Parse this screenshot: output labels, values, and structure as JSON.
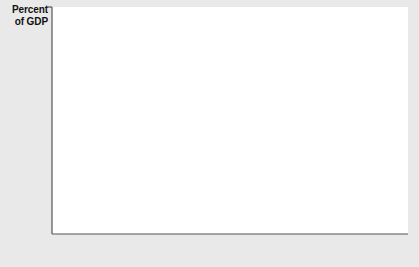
{
  "chart_data": {
    "type": "line",
    "title": "",
    "subtitle": "",
    "ylabel": "Percent of GDP",
    "xlabel": "",
    "ylim": [
      -4,
      4
    ],
    "xlim": [
      1960,
      2001
    ],
    "grid": false,
    "legend": "none",
    "zero_line": true,
    "ytick_labels": [
      "4",
      "3",
      "2",
      "1",
      "0",
      "-1",
      "-2",
      "-3",
      "-4"
    ],
    "yticks": [
      4,
      3,
      2,
      1,
      0,
      -1,
      -2,
      -3,
      -4
    ],
    "xtick_labels": [
      "1960",
      "1965",
      "1970",
      "1975",
      "1980",
      "1985",
      "1990",
      "1995",
      "2000"
    ],
    "xticks": [
      1960,
      1965,
      1970,
      1975,
      1980,
      1985,
      1990,
      1995,
      2000
    ],
    "annotations": [
      {
        "text_line1": "Net capital",
        "text_line2": "outflow",
        "target_x": 1976,
        "target_y": 0.1
      }
    ],
    "series": [
      {
        "name": "Net capital outflow",
        "color": "#333333",
        "x": [
          1960,
          1961,
          1962,
          1963,
          1964,
          1965,
          1966,
          1967,
          1968,
          1969,
          1970,
          1971,
          1972,
          1973,
          1974,
          1975,
          1976,
          1977,
          1978,
          1979,
          1980,
          1981,
          1982,
          1983,
          1984,
          1985,
          1986,
          1987,
          1988,
          1989,
          1990,
          1991,
          1992,
          1993,
          1994,
          1995,
          1996,
          1997,
          1998,
          1999,
          2000,
          2001
        ],
        "values": [
          0.5,
          0.55,
          0.45,
          0.55,
          0.6,
          0.45,
          0.25,
          0.35,
          0.1,
          0.0,
          0.1,
          -0.2,
          -0.45,
          0.3,
          0.15,
          0.9,
          0.2,
          -0.6,
          -1.0,
          -0.8,
          -0.45,
          -0.35,
          -0.35,
          -1.4,
          -2.4,
          -2.7,
          -3.1,
          -3.1,
          -2.4,
          -1.9,
          -1.4,
          -0.3,
          -0.65,
          -1.0,
          -1.0,
          -0.95,
          -0.9,
          -1.1,
          -2.1,
          -3.1,
          -3.85,
          -3.6
        ]
      }
    ]
  },
  "figure": {
    "ylabel_line1": "Percent",
    "ylabel_line2": "of GDP"
  }
}
